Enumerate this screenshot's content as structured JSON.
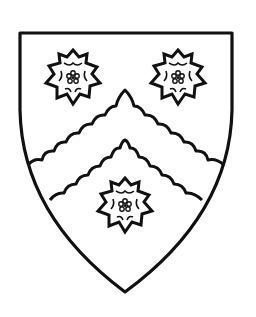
{
  "image": {
    "description": "Heraldic shield: a chevron engrailed between three roses, black line drawing on white",
    "background": "#ffffff",
    "line_color": "#111111"
  },
  "shield": {
    "field": "argent",
    "ordinary": "chevron engrailed",
    "charges": [
      {
        "name": "rose",
        "position": "dexter-chief",
        "cx": 73,
        "cy": 77
      },
      {
        "name": "rose",
        "position": "sinister-chief",
        "cx": 178,
        "cy": 77
      },
      {
        "name": "rose",
        "position": "on-chevron-base",
        "cx": 125,
        "cy": 205
      }
    ]
  }
}
